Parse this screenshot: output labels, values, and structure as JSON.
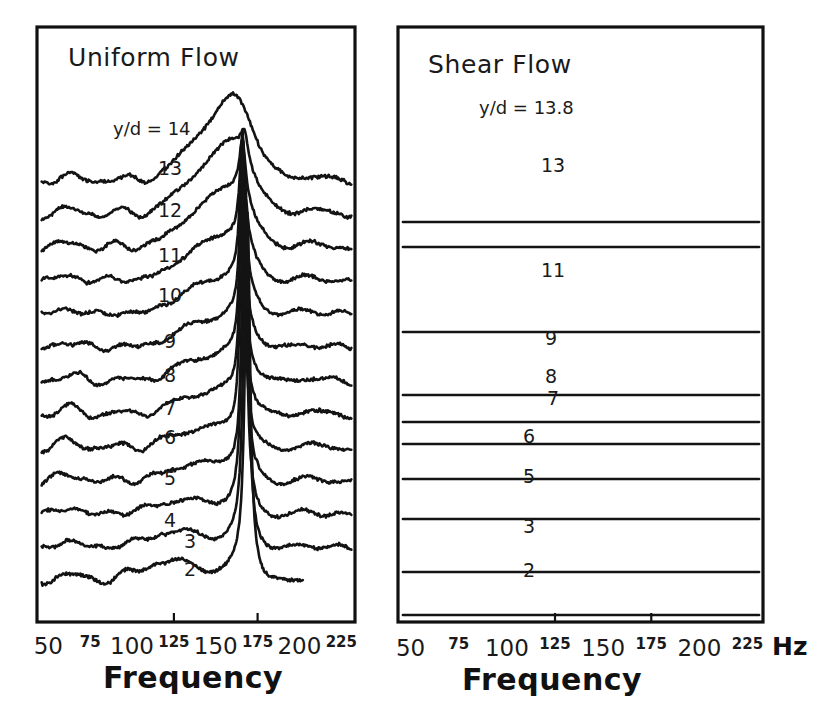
{
  "figure": {
    "type": "multi-panel-spectra",
    "background_color": "#ffffff",
    "ink_color": "#131313"
  },
  "panels": [
    {
      "id": "uniform-flow",
      "title": "Uniform Flow",
      "lead_label": "y/d = 14",
      "trace_labels": [
        "14",
        "13",
        "12",
        "11",
        "10",
        "9",
        "8",
        "7",
        "6",
        "5",
        "4",
        "3",
        "2"
      ],
      "axis_title": "Frequency",
      "unit": ""
    },
    {
      "id": "shear-flow",
      "title": "Shear Flow",
      "lead_label": "y/d = 13.8",
      "trace_labels": [
        "13.8",
        "13",
        "11",
        "9",
        "8",
        "7",
        "6",
        "5",
        "3",
        "2"
      ],
      "axis_title": "Frequency",
      "unit": "Hz"
    }
  ],
  "axis": {
    "ticks": [
      {
        "value": 50,
        "label": "50",
        "size": "major"
      },
      {
        "value": 75,
        "label": "75",
        "size": "minor"
      },
      {
        "value": 100,
        "label": "100",
        "size": "major"
      },
      {
        "value": 125,
        "label": "125",
        "size": "minor"
      },
      {
        "value": 150,
        "label": "150",
        "size": "major"
      },
      {
        "value": 175,
        "label": "175",
        "size": "minor"
      },
      {
        "value": 200,
        "label": "200",
        "size": "major"
      },
      {
        "value": 225,
        "label": "225",
        "size": "minor"
      }
    ],
    "range": [
      45,
      232
    ],
    "unit": "Hz"
  },
  "chart_data": {
    "type": "line",
    "xlabel": "Frequency",
    "xunit": "Hz",
    "ylabel": "",
    "xlim": [
      45,
      232
    ],
    "grid": false,
    "legend": "inline-trace-labels",
    "panels": [
      {
        "name": "Uniform Flow",
        "series": [
          {
            "name": "y/d = 14",
            "peak_hz": 168,
            "broad_hump_hz": 152,
            "peak_sharpness": "broad"
          },
          {
            "name": "13",
            "peak_hz": 167,
            "broad_hump_hz": 150,
            "peak_sharpness": "medium"
          },
          {
            "name": "12",
            "peak_hz": 166,
            "broad_hump_hz": 148,
            "peak_sharpness": "medium"
          },
          {
            "name": "11",
            "peak_hz": 166,
            "broad_hump_hz": 146,
            "peak_sharpness": "sharp"
          },
          {
            "name": "10",
            "peak_hz": 166,
            "broad_hump_hz": 145,
            "peak_sharpness": "sharp"
          },
          {
            "name": "9",
            "peak_hz": 166,
            "broad_hump_hz": 144,
            "peak_sharpness": "sharp"
          },
          {
            "name": "8",
            "peak_hz": 166,
            "broad_hump_hz": 143,
            "peak_sharpness": "sharp"
          },
          {
            "name": "7",
            "peak_hz": 166,
            "broad_hump_hz": 142,
            "peak_sharpness": "sharp"
          },
          {
            "name": "6",
            "peak_hz": 166,
            "broad_hump_hz": 140,
            "peak_sharpness": "sharp"
          },
          {
            "name": "5",
            "peak_hz": 167,
            "broad_hump_hz": 138,
            "peak_sharpness": "sharp"
          },
          {
            "name": "4",
            "peak_hz": 167,
            "broad_hump_hz": 130,
            "peak_sharpness": "sharp"
          },
          {
            "name": "3",
            "peak_hz": 168,
            "broad_hump_hz": 127,
            "peak_sharpness": "sharp"
          },
          {
            "name": "2",
            "peak_hz": 169,
            "broad_hump_hz": 124,
            "peak_sharpness": "sharp"
          }
        ]
      },
      {
        "name": "Shear Flow",
        "series": [
          {
            "name": "y/d = 13.8",
            "peak_hz": 183,
            "secondary_peak_hz": 172,
            "peak_sharpness": "broad"
          },
          {
            "name": "13",
            "peak_hz": 184,
            "secondary_peak_hz": 173,
            "peak_sharpness": "medium"
          },
          {
            "name": "11",
            "peak_hz": 183,
            "secondary_peak_hz": 170,
            "peak_sharpness": "medium"
          },
          {
            "name": "9",
            "peak_hz": 181,
            "secondary_peak_hz": 142,
            "peak_sharpness": "sharp"
          },
          {
            "name": "8",
            "peak_hz": 178,
            "secondary_peak_hz": 141,
            "peak_sharpness": "sharp"
          },
          {
            "name": "7",
            "peak_hz": 175,
            "secondary_peak_hz": 141,
            "peak_sharpness": "sharp"
          },
          {
            "name": "6",
            "peak_hz": 168,
            "secondary_peak_hz": 140,
            "peak_sharpness": "sharp"
          },
          {
            "name": "5",
            "peak_hz": 140,
            "secondary_peak_hz": 163,
            "peak_sharpness": "sharp"
          },
          {
            "name": "3",
            "peak_hz": 140,
            "secondary_peak_hz": 80,
            "peak_sharpness": "sharp"
          },
          {
            "name": "2",
            "peak_hz": 140,
            "secondary_peak_hz": 78,
            "peak_sharpness": "sharp"
          }
        ]
      }
    ]
  }
}
